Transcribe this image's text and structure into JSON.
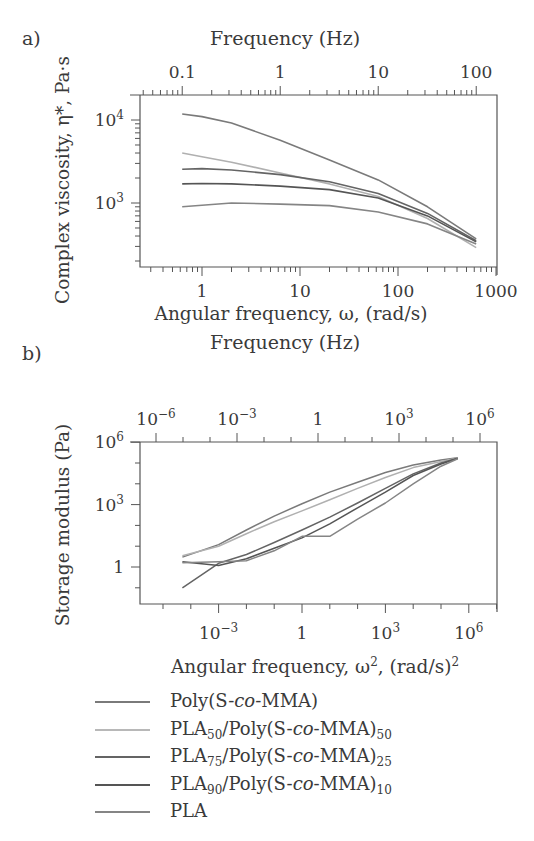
{
  "figure": {
    "panel_a_label": "a)",
    "panel_b_label": "b)"
  },
  "chart_data": [
    {
      "type": "line",
      "panel": "a",
      "title": "",
      "top_axis_label": "Frequency (Hz)",
      "top_ticks": [
        "0.1",
        "1",
        "10",
        "100"
      ],
      "xlabel": "Angular frequency, ω, (rad/s)",
      "ylabel": "Complex viscosity, η*, Pa·s",
      "x_ticks": [
        "1",
        "10",
        "100",
        "1000"
      ],
      "y_ticks": [
        "10^3",
        "10^4"
      ],
      "xscale": "log",
      "yscale": "log",
      "xlim": [
        0.23,
        1000
      ],
      "ylim": [
        180,
        20000
      ],
      "x": [
        0.628,
        1,
        2,
        6.28,
        20,
        62.8,
        200,
        628
      ],
      "series": [
        {
          "name": "Poly(S-co-MMA)",
          "color": "#7a7a7a",
          "values": [
            11800,
            11000,
            9200,
            5700,
            3300,
            1900,
            900,
            370
          ]
        },
        {
          "name": "PLA50/Poly(S-co-MMA)50",
          "color": "#b0b0b0",
          "values": [
            4000,
            3600,
            3100,
            2300,
            1700,
            1200,
            650,
            290
          ]
        },
        {
          "name": "PLA75/Poly(S-co-MMA)25",
          "color": "#646464",
          "values": [
            2550,
            2600,
            2500,
            2200,
            1800,
            1300,
            750,
            350
          ]
        },
        {
          "name": "PLA90/Poly(S-co-MMA)10",
          "color": "#555555",
          "values": [
            1700,
            1720,
            1700,
            1600,
            1450,
            1150,
            700,
            340
          ]
        },
        {
          "name": "PLA",
          "color": "#858585",
          "values": [
            900,
            940,
            1000,
            970,
            930,
            780,
            560,
            320
          ]
        }
      ],
      "legend_position": "below"
    },
    {
      "type": "line",
      "panel": "b",
      "title": "",
      "top_axis_label": "Frequency (Hz)",
      "top_ticks": [
        "10^-6",
        "10^-3",
        "1",
        "10^3",
        "10^6"
      ],
      "xlabel": "Angular frequency, ω², (rad/s)²",
      "ylabel": "Storage modulus (Pa)",
      "x_ticks": [
        "10^-3",
        "1",
        "10^3",
        "10^6"
      ],
      "y_ticks": [
        "1",
        "10^3",
        "10^6"
      ],
      "xscale": "log",
      "yscale": "log",
      "xlim": [
        1.5e-06,
        10000000.0
      ],
      "ylim": [
        0.017,
        1000000.0
      ],
      "x": [
        5e-05,
        0.001,
        0.01,
        0.1,
        1,
        10,
        100,
        1000,
        10000.0,
        100000.0,
        400000.0
      ],
      "series": [
        {
          "name": "Poly(S-co-MMA)",
          "color": "#7a7a7a",
          "values": [
            3,
            12,
            60,
            280,
            1100,
            4000,
            12000,
            35000,
            80000,
            140000,
            180000
          ]
        },
        {
          "name": "PLA50/Poly(S-co-MMA)50",
          "color": "#b0b0b0",
          "values": [
            3.5,
            10,
            40,
            150,
            500,
            1700,
            6000,
            20000,
            60000,
            120000,
            175000
          ]
        },
        {
          "name": "PLA75/Poly(S-co-MMA)25",
          "color": "#646464",
          "values": [
            0.1,
            1.5,
            4,
            15,
            60,
            250,
            1200,
            6000,
            30000,
            100000,
            170000
          ]
        },
        {
          "name": "PLA90/Poly(S-co-MMA)10",
          "color": "#555555",
          "values": [
            1.8,
            1.2,
            2.5,
            8,
            25,
            120,
            700,
            4000,
            25000,
            90000,
            165000
          ]
        },
        {
          "name": "PLA",
          "color": "#858585",
          "values": [
            1.6,
            1.8,
            2,
            6,
            30,
            30,
            200,
            1200,
            10000,
            70000,
            160000
          ]
        }
      ],
      "legend_position": "below"
    }
  ],
  "legend": [
    {
      "base": "Poly(S-",
      "co": "co",
      "rest": "-MMA)",
      "sub1": "",
      "sub2": "",
      "color": "#7a7a7a",
      "width": 2
    },
    {
      "base": "PLA",
      "sub1": "50",
      "mid": "/Poly(S-",
      "co": "co",
      "rest": "-MMA)",
      "sub2": "50",
      "color": "#b8b8b8",
      "width": 2
    },
    {
      "base": "PLA",
      "sub1": "75",
      "mid": "/Poly(S-",
      "co": "co",
      "rest": "-MMA)",
      "sub2": "25",
      "color": "#646464",
      "width": 2
    },
    {
      "base": "PLA",
      "sub1": "90",
      "mid": "/Poly(S-",
      "co": "co",
      "rest": "-MMA)",
      "sub2": "10",
      "color": "#555555",
      "width": 2.4
    },
    {
      "base": "PLA",
      "sub1": "",
      "mid": "",
      "co": "",
      "rest": "",
      "sub2": "",
      "color": "#858585",
      "width": 2
    }
  ]
}
